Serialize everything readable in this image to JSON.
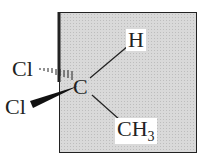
{
  "diagram": {
    "type": "stereochemistry-wedge-dash",
    "molecule": "1,1-dichloroethane",
    "central_atom": "C",
    "substituents": [
      {
        "label": "H",
        "bond": "plain",
        "position": "upper-right"
      },
      {
        "label": "CH3",
        "bond": "plain",
        "position": "lower-right"
      },
      {
        "label": "Cl",
        "bond": "dashed-wedge",
        "position": "upper-left"
      },
      {
        "label": "Cl",
        "bond": "solid-wedge",
        "position": "lower-left"
      }
    ],
    "labels": {
      "center": "C",
      "h": "H",
      "ch3_main": "CH",
      "ch3_sub": "3",
      "cl_top": "Cl",
      "cl_bottom": "Cl"
    },
    "colors": {
      "panel": "#d9d9d9",
      "ink": "#222222",
      "background": "#ffffff"
    }
  }
}
